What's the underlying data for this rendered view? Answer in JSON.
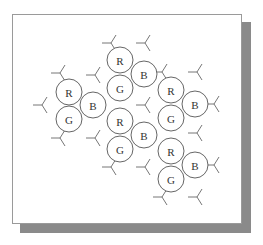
{
  "diagram": {
    "type": "rgb-triad-pattern",
    "colors": {
      "frame_border": "#9a9a9a",
      "shadow": "#8a8a8a",
      "circle_stroke": "#555555",
      "connector_stroke": "#666666",
      "background": "#ffffff"
    },
    "triads": [
      {
        "id": "triad-1",
        "subpixels": [
          {
            "label": "R",
            "cx": 69,
            "cy": 92
          },
          {
            "label": "B",
            "cx": 93,
            "cy": 105
          },
          {
            "label": "G",
            "cx": 69,
            "cy": 119
          }
        ]
      },
      {
        "id": "triad-2",
        "subpixels": [
          {
            "label": "R",
            "cx": 120,
            "cy": 60
          },
          {
            "label": "B",
            "cx": 144,
            "cy": 74
          },
          {
            "label": "G",
            "cx": 120,
            "cy": 88
          }
        ]
      },
      {
        "id": "triad-3",
        "subpixels": [
          {
            "label": "R",
            "cx": 171,
            "cy": 90
          },
          {
            "label": "B",
            "cx": 195,
            "cy": 104
          },
          {
            "label": "G",
            "cx": 171,
            "cy": 118
          }
        ]
      },
      {
        "id": "triad-4",
        "subpixels": [
          {
            "label": "R",
            "cx": 120,
            "cy": 121
          },
          {
            "label": "B",
            "cx": 144,
            "cy": 135
          },
          {
            "label": "G",
            "cx": 120,
            "cy": 149
          }
        ]
      },
      {
        "id": "triad-5",
        "subpixels": [
          {
            "label": "R",
            "cx": 171,
            "cy": 151
          },
          {
            "label": "B",
            "cx": 195,
            "cy": 165
          },
          {
            "label": "G",
            "cx": 171,
            "cy": 179
          }
        ]
      }
    ],
    "connectors": [
      {
        "x": 42,
        "y": 105
      },
      {
        "x": 60,
        "y": 73
      },
      {
        "x": 95,
        "y": 75
      },
      {
        "x": 60,
        "y": 138
      },
      {
        "x": 95,
        "y": 138
      },
      {
        "x": 111,
        "y": 43
      },
      {
        "x": 145,
        "y": 43
      },
      {
        "x": 145,
        "y": 105
      },
      {
        "x": 111,
        "y": 167
      },
      {
        "x": 145,
        "y": 167
      },
      {
        "x": 162,
        "y": 72
      },
      {
        "x": 197,
        "y": 72
      },
      {
        "x": 197,
        "y": 133
      },
      {
        "x": 162,
        "y": 197
      },
      {
        "x": 197,
        "y": 197
      },
      {
        "x": 214,
        "y": 104
      },
      {
        "x": 214,
        "y": 165
      }
    ],
    "circle_radius": 13
  }
}
